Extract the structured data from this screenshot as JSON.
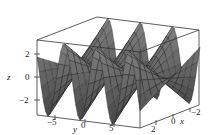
{
  "chart_data": {
    "type": "surface3d",
    "title": "",
    "xlabel": "x",
    "ylabel": "y",
    "zlabel": "z",
    "x_ticks": [
      "2",
      "0",
      "-2"
    ],
    "y_ticks": [
      "-5",
      "0",
      "5"
    ],
    "z_ticks": [
      "2",
      "0",
      "-2"
    ],
    "xlim": [
      -3,
      3
    ],
    "ylim": [
      -8,
      8
    ],
    "zlim": [
      -3,
      3
    ],
    "grid": false,
    "box": true,
    "surface_color": "#444444",
    "mesh_color": "#111111"
  },
  "axes": {
    "z_label": "z",
    "y_label": "y",
    "x_label": "x",
    "z_ticks": [
      {
        "label": "2",
        "x": 20,
        "y": 51
      },
      {
        "label": "0",
        "x": 20,
        "y": 73
      },
      {
        "label": "−2",
        "x": 14,
        "y": 97
      }
    ],
    "y_ticks": [
      {
        "label": "−5",
        "x": 47,
        "y": 117
      },
      {
        "label": "0",
        "x": 80,
        "y": 121
      },
      {
        "label": "5",
        "x": 108,
        "y": 123
      }
    ],
    "x_ticks": [
      {
        "label": "2",
        "x": 152,
        "y": 125
      },
      {
        "label": "0",
        "x": 172,
        "y": 117
      },
      {
        "label": "−2",
        "x": 191,
        "y": 108
      }
    ]
  }
}
